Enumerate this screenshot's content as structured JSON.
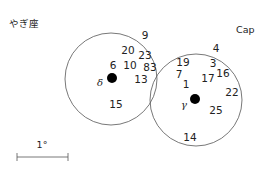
{
  "labels": {
    "constellation_jp": "やぎ座",
    "constellation_abbr": "Cap",
    "scale_label": "1°"
  },
  "colors": {
    "line": "#555555",
    "text": "#222222",
    "dot": "#000000"
  },
  "circles": [
    {
      "name": "left-field-circle",
      "cx": 111,
      "cy": 79,
      "r": 46
    },
    {
      "name": "right-field-circle",
      "cx": 196,
      "cy": 100,
      "r": 46
    }
  ],
  "stars": [
    {
      "name": "delta",
      "symbol": "δ",
      "x": 112,
      "y": 78,
      "r": 5,
      "label_x": 100,
      "label_y": 83
    },
    {
      "name": "gamma",
      "symbol": "γ",
      "x": 195,
      "y": 99,
      "r": 5,
      "label_x": 184,
      "label_y": 105
    }
  ],
  "numbers": [
    {
      "text": "9",
      "x": 145,
      "y": 35
    },
    {
      "text": "20",
      "x": 128,
      "y": 50
    },
    {
      "text": "23",
      "x": 145,
      "y": 55
    },
    {
      "text": "6",
      "x": 113,
      "y": 65
    },
    {
      "text": "10",
      "x": 130,
      "y": 65
    },
    {
      "text": "83",
      "x": 150,
      "y": 67
    },
    {
      "text": "13",
      "x": 141,
      "y": 79
    },
    {
      "text": "15",
      "x": 116,
      "y": 104
    },
    {
      "text": "4",
      "x": 216,
      "y": 48
    },
    {
      "text": "19",
      "x": 183,
      "y": 62
    },
    {
      "text": "3",
      "x": 213,
      "y": 63
    },
    {
      "text": "7",
      "x": 179,
      "y": 74
    },
    {
      "text": "16",
      "x": 223,
      "y": 73
    },
    {
      "text": "17",
      "x": 208,
      "y": 78
    },
    {
      "text": "1",
      "x": 186,
      "y": 84
    },
    {
      "text": "22",
      "x": 232,
      "y": 92
    },
    {
      "text": "25",
      "x": 216,
      "y": 110
    },
    {
      "text": "14",
      "x": 190,
      "y": 137
    }
  ],
  "scale_bar": {
    "x1": 17,
    "x2": 68,
    "y": 157,
    "tick": 4
  }
}
